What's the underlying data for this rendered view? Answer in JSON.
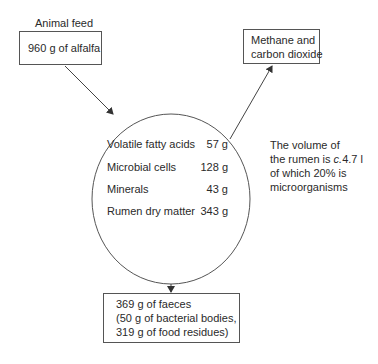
{
  "input": {
    "label": "Animal feed",
    "box_text": "960 g of alfalfa"
  },
  "output_gas": {
    "line1": "Methane and",
    "line2": "carbon dioxide"
  },
  "rumen": {
    "rows": [
      {
        "name": "Volatile fatty acids",
        "value": "57 g"
      },
      {
        "name": "Microbial cells",
        "value": "128 g"
      },
      {
        "name": "Minerals",
        "value": "43 g"
      },
      {
        "name": "Rumen dry matter",
        "value": "343 g"
      }
    ]
  },
  "note": {
    "line1": "The volume of",
    "line2_prefix": "the rumen is ",
    "line2_italic": "c.",
    "line2_suffix": "4.7 l",
    "line3": "of which 20% is",
    "line4": "microorganisms"
  },
  "output_faeces": {
    "line1": "369 g of faeces",
    "line2": "(50 g of bacterial bodies,",
    "line3": "319 g of food residues)"
  },
  "colors": {
    "stroke": "#555555",
    "text": "#2a2a2a"
  }
}
